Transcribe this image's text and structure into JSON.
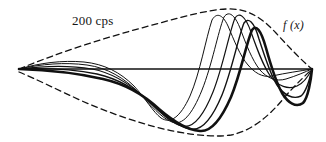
{
  "figure": {
    "background_color": "#ffffff",
    "stroke_color": "#111111",
    "labels": {
      "frequency": "200 cps",
      "function": "f (x)"
    },
    "axis": {
      "name": "baseline-axis",
      "orientation": "horizontal",
      "x_start": 19,
      "x_end": 312,
      "y": 69,
      "stroke_width": 1.5
    }
  },
  "chart_data": {
    "type": "line",
    "xlabel": "",
    "ylabel": "",
    "grid": false,
    "legend_position": "none",
    "annotations": [
      {
        "text": "200 cps",
        "x": 72,
        "y": 14
      },
      {
        "text": "f (x)",
        "x": 283,
        "y": 19
      }
    ],
    "origin": {
      "x": 19,
      "y": 69
    },
    "baseline_y": 69,
    "xlim": [
      19,
      312
    ],
    "ylim": [
      138,
      6
    ],
    "series": [
      {
        "name": "wave-phase-1",
        "stroke_width": 1.0,
        "bold": false,
        "peak": {
          "x": 212,
          "y": 14
        },
        "trough": {
          "x": 161,
          "y": 118
        },
        "path": "M19,69 C40,63 62,60 84,62 C104,64 120,72 134,86 C146,99 153,112 161,118 C170,124 180,118 190,96 C200,73 206,38 212,20 C216,13 222,13 228,26 C234,40 240,56 248,65 C254,72 262,78 272,76 C286,73 300,71 312,69"
      },
      {
        "name": "wave-phase-2",
        "stroke_width": 1.0,
        "bold": false,
        "peak": {
          "x": 222,
          "y": 13
        },
        "trough": {
          "x": 172,
          "y": 122
        },
        "path": "M19,69 C42,64 64,62 87,65 C108,68 124,78 138,92 C151,105 161,118 172,122 C182,126 192,115 202,90 C212,65 218,32 224,17 C228,11 234,13 240,28 C246,44 252,60 260,70 C267,78 276,82 286,79 C296,76 305,72 312,69"
      },
      {
        "name": "wave-phase-3",
        "stroke_width": 1.2,
        "bold": false,
        "peak": {
          "x": 232,
          "y": 15
        },
        "trough": {
          "x": 182,
          "y": 126
        },
        "path": "M19,69 C44,66 68,65 92,69 C113,73 130,84 145,98 C159,111 170,123 182,126 C193,129 203,117 213,92 C223,67 229,33 235,18 C239,12 245,15 251,32 C257,49 263,66 271,77 C278,86 288,90 297,86 C304,83 309,75 312,69"
      },
      {
        "name": "wave-phase-4",
        "stroke_width": 1.4,
        "bold": false,
        "peak": {
          "x": 241,
          "y": 20
        },
        "trough": {
          "x": 191,
          "y": 129
        },
        "path": "M19,69 C46,68 72,69 97,74 C119,79 137,90 152,104 C166,117 178,127 191,129 C202,131 212,119 222,95 C232,70 238,38 244,23 C248,17 254,21 259,39 C265,57 270,74 277,85 C284,95 293,100 301,96 C306,92 310,78 312,69"
      },
      {
        "name": "wave-phase-5",
        "stroke_width": 2.6,
        "bold": true,
        "peak": {
          "x": 250,
          "y": 27
        },
        "trough": {
          "x": 200,
          "y": 131
        },
        "path": "M19,69 C49,70 77,73 103,79 C125,84 144,95 159,109 C173,121 186,130 200,131 C211,132 221,120 231,97 C241,73 246,44 252,30 C256,24 261,30 266,48 C271,66 276,82 282,93 C288,103 296,108 303,103 C308,98 311,80 312,69"
      }
    ],
    "envelopes": [
      {
        "name": "upper-envelope",
        "style": "dashed",
        "dash_pattern": [
          6,
          4
        ],
        "stroke_width": 1.3,
        "peak": {
          "x": 226,
          "y": 9
        },
        "path": "M19,69 C60,52 110,36 160,23 C185,16 208,10 226,9 C248,8 262,18 276,33 C288,46 300,59 312,69"
      },
      {
        "name": "lower-envelope",
        "style": "dashed",
        "dash_pattern": [
          6,
          4
        ],
        "stroke_width": 1.3,
        "trough": {
          "x": 231,
          "y": 135
        },
        "path": "M19,72 C36,79 58,90 82,101 C112,114 146,126 178,132 C200,136 218,137 231,135 C252,131 270,115 284,98 C295,85 305,76 312,69"
      }
    ]
  }
}
